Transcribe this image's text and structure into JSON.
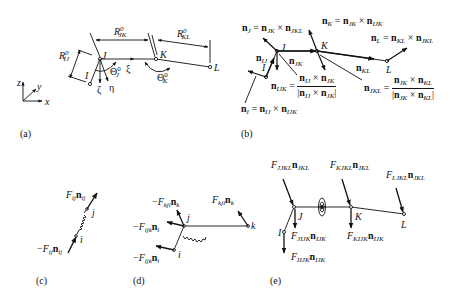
{
  "panels": {
    "a": {
      "label": "(a)",
      "axes": {
        "z": "z",
        "y": "y",
        "x": "x"
      },
      "nodes": {
        "I": "I",
        "J": "J",
        "K": "K",
        "L": "L"
      },
      "local_axes": {
        "xi": "ξ",
        "eta": "η",
        "zeta": "ζ"
      },
      "dims": {
        "R_IJ": {
          "base": "R",
          "sup": "0",
          "sub": "IJ"
        },
        "R_JK": {
          "base": "R",
          "sup": "0",
          "sub": "JK"
        },
        "R_KL": {
          "base": "R",
          "sup": "0",
          "sub": "KL"
        }
      },
      "angles": {
        "Theta_J": {
          "base": "Θ",
          "sup": "0",
          "sub": "J"
        },
        "Theta_K": {
          "base": "Θ",
          "sup": "0",
          "sub": "K"
        }
      }
    },
    "b": {
      "label": "(b)",
      "nodes": {
        "I": "I",
        "J": "J",
        "K": "K",
        "L": "L"
      },
      "vectors": {
        "nJ": {
          "lhs": "n",
          "lhs_sub": "J",
          "eq": " = ",
          "a": "n",
          "a_sub": "JK",
          "op": " × ",
          "b": "n",
          "b_sub": "JKL"
        },
        "nK": {
          "lhs": "n",
          "lhs_sub": "K",
          "eq": " = ",
          "a": "n",
          "a_sub": "JK",
          "op": " × ",
          "b": "n",
          "b_sub": "IJK"
        },
        "nL": {
          "lhs": "n",
          "lhs_sub": "L",
          "eq": " = ",
          "a": "n",
          "a_sub": "KL",
          "op": " × ",
          "b": "n",
          "b_sub": "JKL"
        },
        "nI": {
          "lhs": "n",
          "lhs_sub": "I",
          "eq": " = ",
          "a": "n",
          "a_sub": "IJ",
          "op": " × ",
          "b": "n",
          "b_sub": "IJK"
        },
        "nIJ": {
          "base": "n",
          "sub": "IJ"
        },
        "nJK": {
          "base": "n",
          "sub": "JK"
        },
        "nKL": {
          "base": "n",
          "sub": "KL"
        },
        "nIJK": {
          "lhs": "n",
          "lhs_sub": "IJK",
          "eq": " = ",
          "num_a": "n",
          "num_a_sub": "IJ",
          "num_b": "n",
          "num_b_sub": "JK",
          "op": " × "
        },
        "nJKL": {
          "lhs": "n",
          "lhs_sub": "JKL",
          "eq": " = ",
          "num_a": "n",
          "num_a_sub": "JK",
          "num_b": "n",
          "num_b_sub": "KL",
          "op": " × "
        }
      }
    },
    "c": {
      "label": "(c)",
      "nodes": {
        "i": "i",
        "j": "j"
      },
      "forces": {
        "top": {
          "prefix": "",
          "F": "F",
          "F_sub": "ij",
          "n": "n",
          "n_sub": "ij"
        },
        "bottom": {
          "prefix": "−",
          "F": "F",
          "F_sub": "ij",
          "n": "n",
          "n_sub": "ij"
        }
      }
    },
    "d": {
      "label": "(d)",
      "nodes": {
        "i": "i",
        "j": "j",
        "k": "k"
      },
      "forces": {
        "f1": {
          "prefix": "−",
          "F": "F",
          "F_sub": "kji",
          "n": "n",
          "n_sub": "k"
        },
        "f2": {
          "prefix": "",
          "F": "F",
          "F_sub": "kji",
          "n": "n",
          "n_sub": "k"
        },
        "f3": {
          "prefix": "−",
          "F": "F",
          "F_sub": "ijk",
          "n": "n",
          "n_sub": "i"
        },
        "f4": {
          "prefix": "−",
          "F": "F",
          "F_sub": "ijk",
          "n": "n",
          "n_sub": "i"
        }
      }
    },
    "e": {
      "label": "(e)",
      "nodes": {
        "I": "I",
        "J": "J",
        "K": "K",
        "L": "L"
      },
      "forces": {
        "FJ_JKL": {
          "F": "F",
          "F_sub": "JJKL",
          "n": "n",
          "n_sub": "JKL"
        },
        "FK_JKL": {
          "F": "F",
          "F_sub": "KJKL",
          "n": "n",
          "n_sub": "JKL"
        },
        "FL_JKL": {
          "F": "F",
          "F_sub": "LJKL",
          "n": "n",
          "n_sub": "JKL"
        },
        "FJ_IJK": {
          "F": "F",
          "F_sub": "JIJK",
          "n": "n",
          "n_sub": "IJK"
        },
        "FK_IJK": {
          "F": "F",
          "F_sub": "KIJK",
          "n": "n",
          "n_sub": "IJK"
        },
        "FI_IJK": {
          "F": "F",
          "F_sub": "IIJK",
          "n": "n",
          "n_sub": "IJK"
        }
      }
    }
  }
}
